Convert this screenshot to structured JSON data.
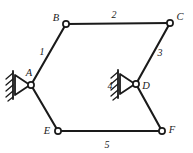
{
  "diagram": {
    "type": "mechanism-kinematic-diagram",
    "background_color": "#ffffff",
    "line_color": "#1a1a1a",
    "joints": [
      {
        "id": "A",
        "label": "A",
        "x": 31,
        "y": 85,
        "label_x": 31,
        "label_y": 74,
        "grounded": true
      },
      {
        "id": "B",
        "label": "B",
        "x": 66,
        "y": 24,
        "label_x": 55,
        "label_y": 21,
        "grounded": false
      },
      {
        "id": "C",
        "label": "C",
        "x": 170,
        "y": 23,
        "label_x": 179,
        "label_y": 19,
        "grounded": false
      },
      {
        "id": "D",
        "label": "D",
        "x": 136,
        "y": 84,
        "label_x": 145,
        "label_y": 88,
        "grounded": true
      },
      {
        "id": "E",
        "label": "E",
        "x": 58,
        "y": 131,
        "label_x": 46,
        "label_y": 133,
        "grounded": false
      },
      {
        "id": "F",
        "label": "F",
        "x": 162,
        "y": 131,
        "label_x": 171,
        "label_y": 131,
        "grounded": false
      }
    ],
    "links": [
      {
        "id": "link-1",
        "label": "1",
        "from": "A",
        "to": "B",
        "label_x": 41,
        "label_y": 52
      },
      {
        "id": "link-2",
        "label": "2",
        "from": "B",
        "to": "C",
        "label_x": 114,
        "label_y": 17
      },
      {
        "id": "link-3",
        "label": "3",
        "from": "C",
        "to": "D",
        "label_x": 159,
        "label_y": 53
      },
      {
        "id": "link-5",
        "label": "5",
        "from": "E",
        "to": "F",
        "label_x": 107,
        "label_y": 146
      },
      {
        "id": "link-ae",
        "label": "",
        "from": "A",
        "to": "E",
        "label_x": 0,
        "label_y": 0
      },
      {
        "id": "link-df",
        "label": "",
        "from": "D",
        "to": "F",
        "label_x": 0,
        "label_y": 0
      }
    ],
    "supports": [
      {
        "id": "support-A",
        "at_joint": "A",
        "label": "",
        "label_x": 0,
        "label_y": 0,
        "wall_x": 13,
        "wall_top": 71,
        "wall_bottom": 99,
        "tri_apex_x": 30,
        "tri_back_x": 15
      },
      {
        "id": "support-D",
        "at_joint": "D",
        "label": "4",
        "label_x": 110,
        "label_y": 88,
        "wall_x": 118,
        "wall_top": 70,
        "wall_bottom": 98,
        "tri_apex_x": 135,
        "tri_back_x": 120
      }
    ],
    "labels": {
      "title": "",
      "caption": ""
    }
  }
}
